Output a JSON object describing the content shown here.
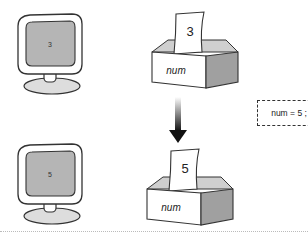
{
  "before": {
    "monitor_value": "3",
    "box_value": "3",
    "box_label": "num"
  },
  "after": {
    "monitor_value": "5",
    "box_value": "5",
    "box_label": "num"
  },
  "statement": "num = 5 ;",
  "colors": {
    "screen_fill": "#b5b5b5",
    "box_side": "#a0a0a0",
    "arrow": "#111111"
  }
}
